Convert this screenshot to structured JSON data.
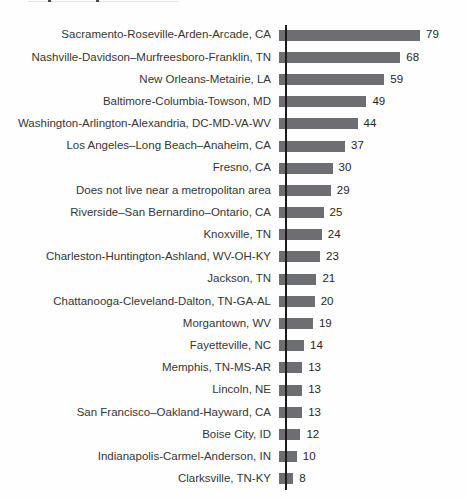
{
  "chart_data": {
    "type": "bar",
    "orientation": "horizontal",
    "title": "",
    "xlabel": "",
    "ylabel": "",
    "xlim": [
      0,
      80
    ],
    "grid": false,
    "legend": false,
    "bar_color": "#6d6e71",
    "axis_color": "#1c1c1c",
    "categories": [
      "Sacramento-Roseville-Arden-Arcade, CA",
      "Nashville-Davidson–Murfreesboro-Franklin, TN",
      "New Orleans-Metairie, LA",
      "Baltimore-Columbia-Towson, MD",
      "Washington-Arlington-Alexandria, DC-MD-VA-WV",
      "Los Angeles–Long Beach–Anaheim, CA",
      "Fresno, CA",
      "Does not live near a metropolitan area",
      "Riverside–San Bernardino–Ontario, CA",
      "Knoxville, TN",
      "Charleston-Huntington-Ashland, WV-OH-KY",
      "Jackson, TN",
      "Chattanooga-Cleveland-Dalton, TN-GA-AL",
      "Morgantown, WV",
      "Fayetteville, NC",
      "Memphis, TN-MS-AR",
      "Lincoln, NE",
      "San Francisco–Oakland-Hayward, CA",
      "Boise City, ID",
      "Indianapolis-Carmel-Anderson, IN",
      "Clarksville, TN-KY"
    ],
    "values": [
      79,
      68,
      59,
      49,
      44,
      37,
      30,
      29,
      25,
      24,
      23,
      21,
      20,
      19,
      14,
      13,
      13,
      13,
      12,
      10,
      8
    ]
  }
}
